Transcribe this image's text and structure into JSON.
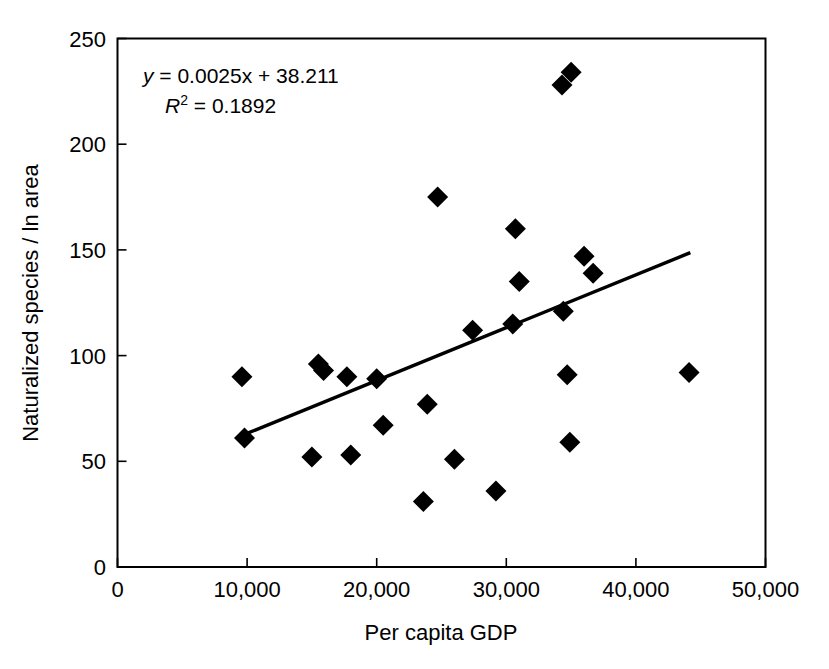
{
  "chart_data": {
    "type": "scatter",
    "title": "",
    "xlabel": "Per capita GDP",
    "ylabel": "Naturalized species / ln area",
    "xlim": [
      0,
      50000
    ],
    "ylim": [
      0,
      250
    ],
    "grid": false,
    "legend": null,
    "xticks": [
      0,
      10000,
      20000,
      30000,
      40000,
      50000
    ],
    "xtick_labels": [
      "0",
      "10,000",
      "20,000",
      "30,000",
      "40,000",
      "50,000"
    ],
    "yticks": [
      0,
      50,
      100,
      150,
      200,
      250
    ],
    "ytick_labels": [
      "0",
      "50",
      "100",
      "150",
      "200",
      "250"
    ],
    "marker": "diamond",
    "marker_color": "#000000",
    "points": [
      {
        "x": 9600,
        "y": 90
      },
      {
        "x": 9800,
        "y": 61
      },
      {
        "x": 15000,
        "y": 52
      },
      {
        "x": 15500,
        "y": 96
      },
      {
        "x": 15900,
        "y": 93
      },
      {
        "x": 17700,
        "y": 90
      },
      {
        "x": 18000,
        "y": 53
      },
      {
        "x": 20000,
        "y": 89
      },
      {
        "x": 20500,
        "y": 67
      },
      {
        "x": 23600,
        "y": 31
      },
      {
        "x": 23900,
        "y": 77
      },
      {
        "x": 24700,
        "y": 175
      },
      {
        "x": 26000,
        "y": 51
      },
      {
        "x": 27400,
        "y": 112
      },
      {
        "x": 29200,
        "y": 36
      },
      {
        "x": 30500,
        "y": 115
      },
      {
        "x": 30700,
        "y": 160
      },
      {
        "x": 31000,
        "y": 135
      },
      {
        "x": 34300,
        "y": 228
      },
      {
        "x": 34400,
        "y": 121
      },
      {
        "x": 34700,
        "y": 91
      },
      {
        "x": 34900,
        "y": 59
      },
      {
        "x": 35000,
        "y": 234
      },
      {
        "x": 36000,
        "y": 147
      },
      {
        "x": 36700,
        "y": 139
      },
      {
        "x": 44100,
        "y": 92
      }
    ],
    "trendline": {
      "slope": 0.0025,
      "intercept": 38.211,
      "r_squared": 0.1892,
      "x_start": 9850,
      "x_end": 44200
    },
    "annotations": {
      "equation_line1_prefix": "y",
      "equation_line1_rest": " = 0.0025x + 38.211",
      "equation_line2_prefix": "R",
      "equation_line2_superscript": "2",
      "equation_line2_rest": " = 0.1892"
    }
  }
}
